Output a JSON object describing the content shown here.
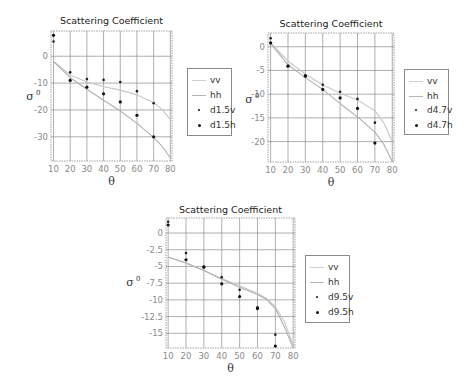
{
  "chart_data": [
    {
      "type": "scatter",
      "title": "Scattering Coefficient",
      "xlabel": "θ",
      "ylabel": "σ⁰",
      "xlim": [
        8.5,
        81
      ],
      "ylim": [
        -39,
        9.4
      ],
      "xticks": [
        10,
        20,
        30,
        40,
        50,
        60,
        70,
        80
      ],
      "yticks": [
        0,
        -10,
        -20,
        -30
      ],
      "ytick_labels": [
        "0",
        "-10",
        "-20",
        "-30"
      ],
      "grid": true,
      "legend_position": "right",
      "series": [
        {
          "name": "vv",
          "kind": "line",
          "color": "#c8c8c8",
          "x": [
            10,
            20,
            30,
            40,
            50,
            60,
            70,
            75,
            80
          ],
          "y": [
            -1.8,
            -7.0,
            -9.6,
            -11.3,
            -12.6,
            -14.4,
            -17.2,
            -19.8,
            -23.5
          ]
        },
        {
          "name": "hh",
          "kind": "line",
          "color": "#b0b0b0",
          "x": [
            10,
            20,
            30,
            40,
            50,
            60,
            70,
            75,
            80
          ],
          "y": [
            -2.0,
            -8.0,
            -12.3,
            -16.4,
            -20.4,
            -25.0,
            -30.2,
            -33.5,
            -37.8
          ]
        },
        {
          "name": "d1.5v",
          "kind": "points",
          "color": "#222222",
          "x": [
            10,
            20,
            30,
            40,
            50,
            60,
            70
          ],
          "y": [
            5.5,
            -6.0,
            -8.5,
            -8.8,
            -9.6,
            -13.0,
            -17.5
          ]
        },
        {
          "name": "d1.5h",
          "kind": "points",
          "color": "#111111",
          "x": [
            10,
            20,
            30,
            40,
            50,
            60,
            70
          ],
          "y": [
            7.8,
            -9.0,
            -11.5,
            -14.0,
            -17.0,
            -22.0,
            -30.0
          ]
        }
      ]
    },
    {
      "type": "scatter",
      "title": "Scattering Coefficient",
      "xlabel": "θ",
      "ylabel": "σ⁰",
      "xlim": [
        8.5,
        81
      ],
      "ylim": [
        -24.3,
        2.9
      ],
      "xticks": [
        10,
        20,
        30,
        40,
        50,
        60,
        70,
        80
      ],
      "yticks": [
        0,
        -5,
        -10,
        -15,
        -20
      ],
      "ytick_labels": [
        "0",
        "-5",
        "-10",
        "-15",
        "-20"
      ],
      "grid": true,
      "legend_position": "right",
      "series": [
        {
          "name": "vv",
          "kind": "line",
          "color": "#c8c8c8",
          "x": [
            10,
            20,
            30,
            40,
            50,
            60,
            70,
            75,
            80
          ],
          "y": [
            0.8,
            -3.0,
            -5.8,
            -8.0,
            -9.8,
            -11.2,
            -13.5,
            -16.0,
            -20.0
          ]
        },
        {
          "name": "hh",
          "kind": "line",
          "color": "#b0b0b0",
          "x": [
            10,
            20,
            30,
            40,
            50,
            60,
            70,
            75,
            80
          ],
          "y": [
            0.7,
            -3.8,
            -6.5,
            -9.0,
            -12.0,
            -14.8,
            -18.0,
            -20.5,
            -24.2
          ]
        },
        {
          "name": "d4.7v",
          "kind": "points",
          "color": "#222222",
          "x": [
            10,
            20,
            30,
            40,
            50,
            60,
            70
          ],
          "y": [
            1.8,
            -4.0,
            -6.0,
            -8.0,
            -9.5,
            -11.0,
            -16.0
          ]
        },
        {
          "name": "d4.7h",
          "kind": "points",
          "color": "#111111",
          "x": [
            10,
            20,
            30,
            40,
            50,
            60,
            70
          ],
          "y": [
            0.8,
            -4.1,
            -6.2,
            -9.0,
            -10.8,
            -13.0,
            -20.3
          ]
        }
      ]
    },
    {
      "type": "scatter",
      "title": "Scattering Coefficient",
      "xlabel": "θ",
      "ylabel": "σ⁰",
      "xlim": [
        8.8,
        81
      ],
      "ylim": [
        -17.2,
        2.25
      ],
      "xticks": [
        10,
        20,
        30,
        40,
        50,
        60,
        70,
        80
      ],
      "yticks": [
        0,
        -2.5,
        -5,
        -7.5,
        -10,
        -12.5,
        -15
      ],
      "ytick_labels": [
        "0",
        "-2.5",
        "-5",
        "-7.5",
        "-10",
        "-12.5",
        "-15"
      ],
      "grid": true,
      "legend_position": "right",
      "series": [
        {
          "name": "vv",
          "kind": "line",
          "color": "#c8c8c8",
          "x": [
            10,
            20,
            30,
            40,
            50,
            60,
            65,
            70,
            75,
            80
          ],
          "y": [
            -3.6,
            -4.5,
            -5.6,
            -6.8,
            -7.9,
            -9.0,
            -9.8,
            -11.0,
            -13.2,
            -16.8
          ]
        },
        {
          "name": "hh",
          "kind": "line",
          "color": "#b0b0b0",
          "x": [
            10,
            20,
            30,
            40,
            50,
            60,
            65,
            70,
            75,
            80
          ],
          "y": [
            -3.6,
            -4.5,
            -5.6,
            -6.9,
            -8.1,
            -9.2,
            -9.9,
            -11.3,
            -14.0,
            -17.2
          ]
        },
        {
          "name": "d9.5v",
          "kind": "points",
          "color": "#222222",
          "x": [
            10,
            20,
            30,
            40,
            50,
            60,
            70
          ],
          "y": [
            1.7,
            -3.0,
            -5.0,
            -6.6,
            -8.5,
            -11.1,
            -15.2
          ]
        },
        {
          "name": "d9.5h",
          "kind": "points",
          "color": "#111111",
          "x": [
            10,
            20,
            30,
            40,
            50,
            60,
            70
          ],
          "y": [
            1.2,
            -4.0,
            -5.1,
            -7.6,
            -9.5,
            -11.3,
            -16.9
          ]
        }
      ]
    }
  ],
  "charts": [
    {
      "title": "Scattering Coefficient",
      "xlabel": "θ",
      "ylabel": "σ",
      "ylabel_sup": "0",
      "legend": [
        "vv",
        "hh",
        "d1.5v",
        "d1.5h"
      ]
    },
    {
      "title": "Scattering Coefficient",
      "xlabel": "θ",
      "ylabel": "σ",
      "ylabel_sup": "0",
      "legend": [
        "vv",
        "hh",
        "d4.7v",
        "d4.7h"
      ]
    },
    {
      "title": "Scattering Coefficient",
      "xlabel": "θ",
      "ylabel": "σ",
      "ylabel_sup": "0",
      "legend": [
        "vv",
        "hh",
        "d9.5v",
        "d9.5h"
      ]
    }
  ],
  "colors": {
    "grid": "#8c8c8c",
    "frame": "#8c8c8c",
    "tick_label": "#8a8a8a",
    "vv_line": "#c8c8c8",
    "hh_line": "#b0b0b0",
    "points": "#111111"
  }
}
